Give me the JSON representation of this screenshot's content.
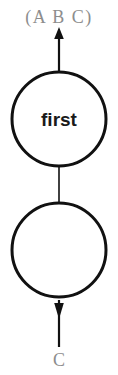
{
  "canvas": {
    "width": 118,
    "height": 375,
    "background": "#ffffff"
  },
  "colors": {
    "stroke": "#111111",
    "node_fill": "#ffffff",
    "node_text": "#1a1a1a",
    "label_text": "#8d8d8d"
  },
  "diagram": {
    "type": "flow-graph",
    "orientation": "vertical",
    "input_label": "(A B C)",
    "output_label": "C",
    "nodes": [
      {
        "id": "node-first",
        "label": "first",
        "cx": 59,
        "cy": 119,
        "r": 47,
        "stroke_width": 3
      },
      {
        "id": "node-empty",
        "label": "",
        "cx": 59,
        "cy": 250,
        "r": 47,
        "stroke_width": 3
      }
    ],
    "edges": [
      {
        "id": "edge-in",
        "from": "input",
        "to": "node-first",
        "arrow": "up"
      },
      {
        "id": "edge-mid",
        "from": "node-first",
        "to": "node-empty",
        "arrow": "none"
      },
      {
        "id": "edge-out",
        "from": "node-empty",
        "to": "output",
        "arrow": "down"
      }
    ]
  }
}
